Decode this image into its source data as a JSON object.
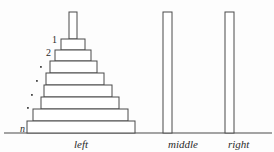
{
  "figure": {
    "type": "tower-of-hanoi-diagram",
    "background_color": "#fdfdfd",
    "stroke_color": "#4a4a4a",
    "fill_color": "#ffffff",
    "text_color": "#2b2b2b"
  },
  "baseline": {
    "y": 133,
    "x_start": 4,
    "x_end": 272
  },
  "pegs": [
    {
      "id": "left",
      "label": "left",
      "label_x": 74,
      "label_y": 139,
      "rod": {
        "x": 69,
        "y": 12,
        "width": 8,
        "height": 27
      },
      "has_disks": true
    },
    {
      "id": "middle",
      "label": "middle",
      "label_x": 168,
      "label_y": 139,
      "rod": {
        "x": 163,
        "y": 12,
        "width": 9,
        "height": 121
      },
      "has_disks": false
    },
    {
      "id": "right",
      "label": "right",
      "label_x": 228,
      "label_y": 139,
      "rod": {
        "x": 225,
        "y": 12,
        "width": 9,
        "height": 121
      },
      "has_disks": false
    }
  ],
  "disks": [
    {
      "index": 1,
      "x": 61,
      "y": 39,
      "width": 24,
      "height": 11
    },
    {
      "index": 2,
      "x": 55,
      "y": 50,
      "width": 36,
      "height": 11
    },
    {
      "index": 3,
      "x": 50,
      "y": 61,
      "width": 47,
      "height": 12
    },
    {
      "index": 4,
      "x": 46,
      "y": 73,
      "width": 58,
      "height": 12
    },
    {
      "index": 5,
      "x": 44,
      "y": 85,
      "width": 68,
      "height": 12
    },
    {
      "index": 6,
      "x": 41,
      "y": 97,
      "width": 78,
      "height": 12
    },
    {
      "index": 7,
      "x": 33,
      "y": 109,
      "width": 95,
      "height": 12
    },
    {
      "index": 8,
      "x": 27,
      "y": 121,
      "width": 108,
      "height": 12
    }
  ],
  "disk_labels": [
    {
      "text": "1",
      "x": 52,
      "y": 35
    },
    {
      "text": "2",
      "x": 46,
      "y": 48
    }
  ],
  "bottom_label": {
    "text": "n",
    "x": 20,
    "y": 124
  },
  "ellipsis_dots": [
    {
      "x": 40,
      "y": 66
    },
    {
      "x": 36,
      "y": 80
    },
    {
      "x": 31,
      "y": 94
    },
    {
      "x": 27,
      "y": 107
    }
  ]
}
